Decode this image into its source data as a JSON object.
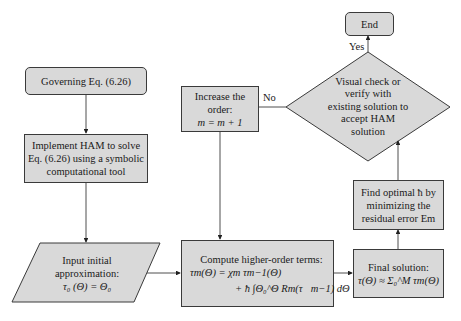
{
  "flowchart": {
    "start": {
      "label": "Governing Eq. (6.26)"
    },
    "implement": {
      "lines": [
        "Implement HAM to solve",
        "Eq. (6.26) using a symbolic",
        "computational tool"
      ]
    },
    "input": {
      "lines": [
        "Input initial",
        "approximation:",
        "τ₀ (Θ) = Θ₀"
      ]
    },
    "increase": {
      "lines": [
        "Increase the",
        "order:",
        "m = m + 1"
      ]
    },
    "compute": {
      "lines": [
        "Compute higher-order terms:",
        "τm(Θ) = χm τm−1(Θ)",
        "+ ħ ∫Θ₀^Θ Rm(τ⃗m−1) dΘ"
      ]
    },
    "final": {
      "lines": [
        "Final solution:",
        "τ(Θ) ≈ Σ₀^M τm(Θ)"
      ]
    },
    "optimal": {
      "lines": [
        "Find optimal ħ by",
        "minimizing the",
        "residual error Em"
      ]
    },
    "decision": {
      "lines": [
        "Visual check or",
        "verify with",
        "existing solution to",
        "accept HAM",
        "solution"
      ]
    },
    "end": {
      "label": "End"
    },
    "edge_labels": {
      "yes": "Yes",
      "no": "No"
    },
    "colors": {
      "fill": "#d9d9d9",
      "stroke": "#3a3a3a",
      "background": "#ffffff"
    }
  }
}
